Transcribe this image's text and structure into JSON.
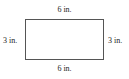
{
  "diagram": {
    "shape": "rectangle",
    "labels": {
      "top": "6 in.",
      "bottom": "6 in.",
      "left": "3 in.",
      "right": "3 in."
    }
  }
}
